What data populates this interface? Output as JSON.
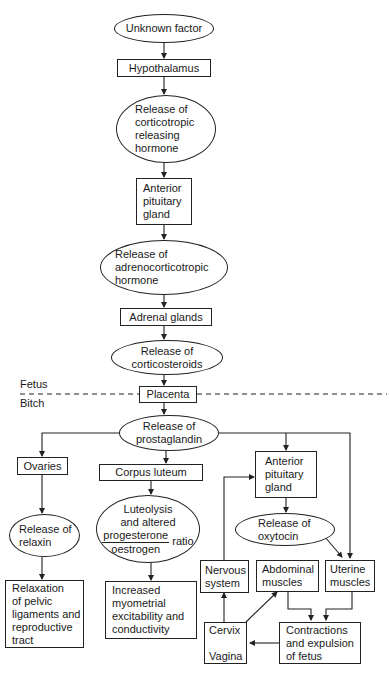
{
  "diagram": {
    "regions": {
      "fetus_label": "Fetus",
      "bitch_label": "Bitch"
    },
    "nodes": {
      "unknown_factor": "Unknown factor",
      "hypothalamus": "Hypothalamus",
      "crh_release": "Release of\ncorticotropic\nreleasing\nhormone",
      "anterior_pituitary_fetal": "Anterior\npituitary\ngland",
      "acth_release": "Release of\nadrenocorticotropic\nhormone",
      "adrenal_glands": "Adrenal glands",
      "corticosteroids_release": "Release of\ncorticosteroids",
      "placenta": "Placenta",
      "prostaglandin_release": "Release of\nprostaglandin",
      "ovaries": "Ovaries",
      "corpus_luteum": "Corpus luteum",
      "relaxin_release": "Release of\nrelaxin",
      "luteolysis": {
        "line1": "Luteolysis",
        "line2": "and altered",
        "numerator": "progesterone",
        "denominator": "oestrogen",
        "suffix": "ratio"
      },
      "anterior_pituitary_maternal": "Anterior\npituitary\ngland",
      "oxytocin_release": "Release of\noxytocin",
      "relaxation": "Relaxation\nof pelvic\nligaments and\nreproductive\ntract",
      "myometrial": "Increased\nmyometrial\nexcitability and\nconductivity",
      "nervous_system": "Nervous\nsystem",
      "abdominal_muscles": "Abdominal\nmuscles",
      "uterine_muscles": "Uterine\nmuscles",
      "cervix_vagina": "Cervix\n\nVagina",
      "contractions": "Contractions\nand expulsion\nof fetus"
    }
  }
}
